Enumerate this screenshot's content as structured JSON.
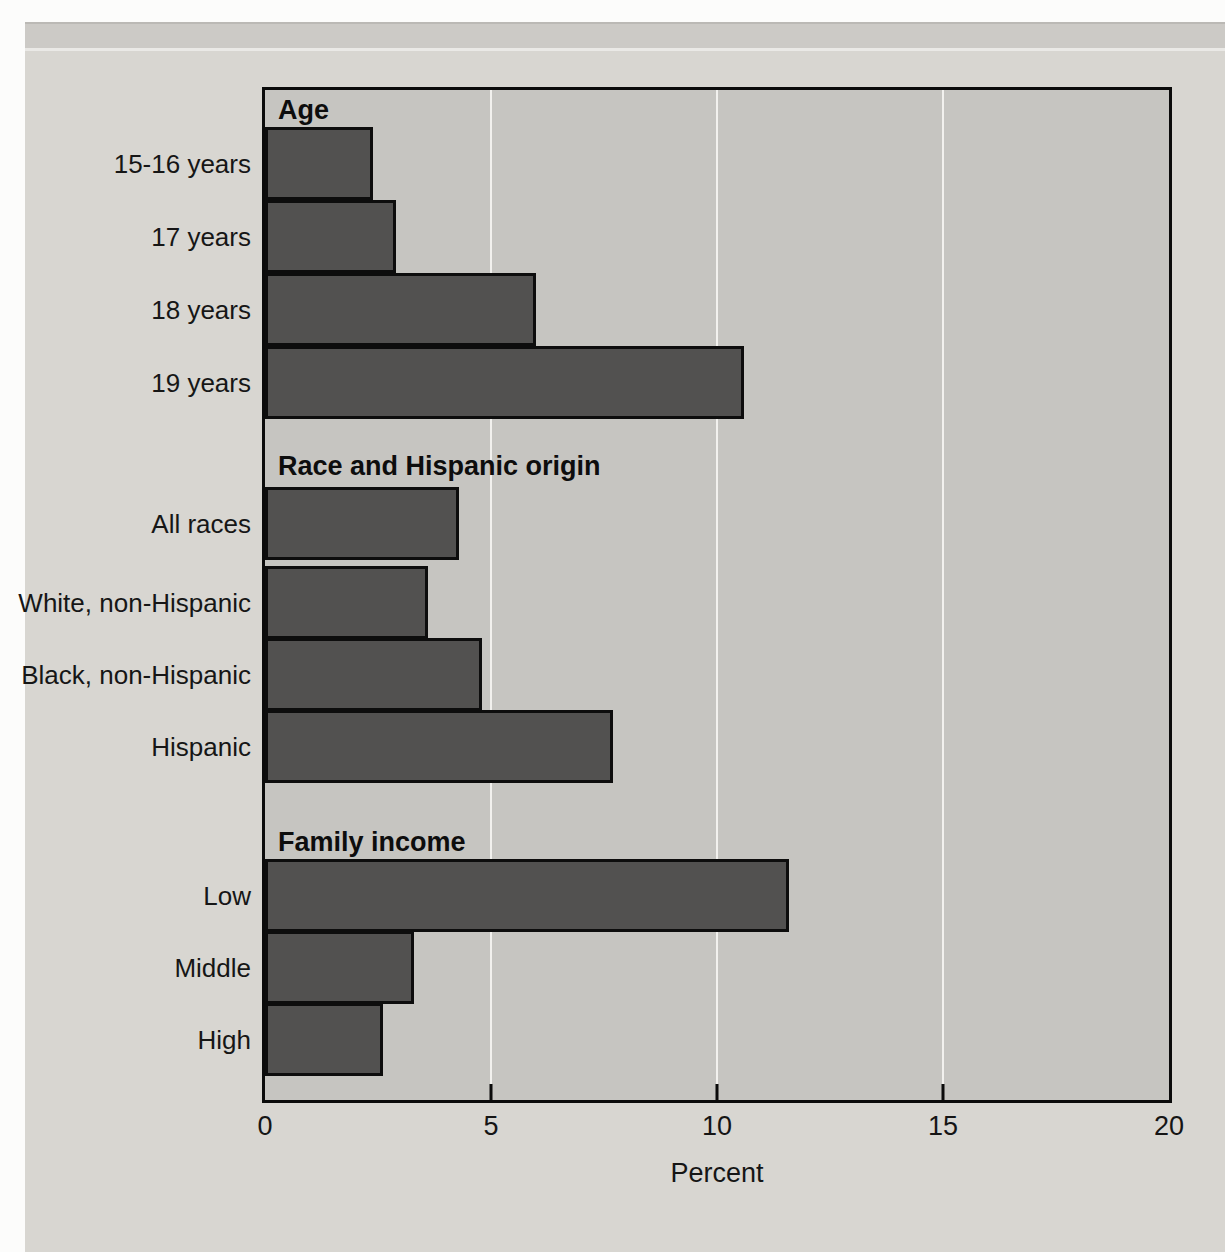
{
  "chart_data": {
    "type": "bar",
    "orientation": "horizontal",
    "title": "",
    "xlabel": "Percent",
    "ylabel": "",
    "xlim": [
      0,
      20
    ],
    "xticks": [
      0,
      5,
      10,
      15,
      20
    ],
    "gridlines": true,
    "groups": [
      {
        "header": "Age",
        "categories": [
          "15-16 years",
          "17 years",
          "18 years",
          "19 years"
        ],
        "values": [
          2.4,
          2.9,
          6.0,
          10.6
        ]
      },
      {
        "header": "Race and Hispanic origin",
        "categories": [
          "All races",
          "White, non-Hispanic",
          "Black, non-Hispanic",
          "Hispanic"
        ],
        "values": [
          4.3,
          3.6,
          4.8,
          7.7
        ]
      },
      {
        "header": "Family income",
        "categories": [
          "Low",
          "Middle",
          "High"
        ],
        "values": [
          11.6,
          3.3,
          2.6
        ]
      }
    ],
    "colors": {
      "bar_fill": "#525150",
      "bar_border": "#0d0d0d",
      "plot_bg": "#c6c5c1",
      "plot_border": "#0b0b0b",
      "page_bg": "#d8d6d1",
      "gridline": "#f2f1ee",
      "text": "#141414"
    }
  }
}
